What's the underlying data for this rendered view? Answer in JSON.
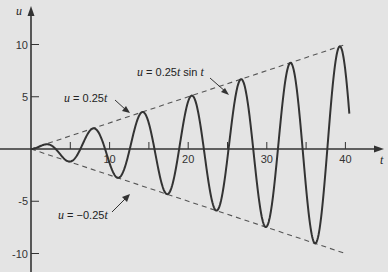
{
  "chart_data": {
    "type": "line",
    "title": "",
    "xlabel": "t",
    "ylabel": "u",
    "xlim": [
      0,
      42
    ],
    "ylim": [
      -11,
      12.5
    ],
    "grid": false,
    "xticks": [
      5,
      10,
      15,
      20,
      25,
      30,
      35,
      40
    ],
    "xtick_labels": [
      "",
      "10",
      "",
      "20",
      "",
      "30",
      "",
      "40"
    ],
    "yticks": [
      10,
      5,
      -5,
      -10
    ],
    "ytick_labels": [
      "10",
      "5",
      "-5",
      "-10"
    ],
    "series": [
      {
        "name": "u = 0.25t sin t",
        "expression": "0.25*t*sin(t)",
        "t_range": [
          0,
          40.5
        ],
        "style": "solid",
        "color": "#333333"
      },
      {
        "name": "u = 0.25t",
        "expression": "0.25*t",
        "t_range": [
          0,
          40
        ],
        "style": "dashed",
        "color": "#555555"
      },
      {
        "name": "u = -0.25t",
        "expression": "-0.25*t",
        "t_range": [
          0,
          40
        ],
        "style": "dashed",
        "color": "#555555"
      }
    ],
    "annotations": [
      {
        "id": "sin",
        "prefix": "u",
        "text": " = 0.25",
        "var": "t",
        "suffix": " sin ",
        "var2": "t",
        "points_to_t": 25
      },
      {
        "id": "upper",
        "prefix": "u",
        "text": " = 0.25",
        "var": "t",
        "suffix": "",
        "var2": "",
        "points_to_t": 12
      },
      {
        "id": "lower",
        "prefix": "u",
        "text": " = −0.25",
        "var": "t",
        "suffix": "",
        "var2": "",
        "points_to_t": 12
      }
    ]
  },
  "colors": {
    "background": "#e4e4e4",
    "curve": "#333333",
    "envelope": "#555555",
    "axis": "#333333"
  }
}
